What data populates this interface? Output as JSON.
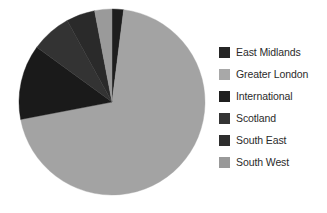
{
  "chart_data": {
    "type": "pie",
    "title": "",
    "subtitle": "",
    "xlabel": "",
    "ylabel": "",
    "grid": false,
    "legend_position": "right",
    "start_angle_deg": 0,
    "direction": "clockwise",
    "categories": [
      "East Midlands",
      "Greater London",
      "International",
      "Scotland",
      "South East",
      "South West"
    ],
    "values": [
      2,
      70,
      13,
      7,
      5,
      3
    ],
    "units": "percent",
    "slices": [
      {
        "label": "East Midlands",
        "value": 2,
        "percent": 2,
        "angle_deg": 7.2,
        "color": "#1e1e1e",
        "swatch_color": "#262626"
      },
      {
        "label": "Greater London",
        "value": 70,
        "percent": 70,
        "angle_deg": 252,
        "color": "#a3a3a3",
        "swatch_color": "#a8a8a8"
      },
      {
        "label": "International",
        "value": 13,
        "percent": 13,
        "angle_deg": 46.8,
        "color": "#1a1a1a",
        "swatch_color": "#1f1f1f"
      },
      {
        "label": "Scotland",
        "value": 7,
        "percent": 7,
        "angle_deg": 25.2,
        "color": "#333333",
        "swatch_color": "#343434"
      },
      {
        "label": "South East",
        "value": 5,
        "percent": 5,
        "angle_deg": 18,
        "color": "#2a2a2a",
        "swatch_color": "#2e2e2e"
      },
      {
        "label": "South West",
        "value": 3,
        "percent": 3,
        "angle_deg": 10.8,
        "color": "#9a9a9a",
        "swatch_color": "#999999"
      }
    ]
  },
  "legend": {
    "items": [
      {
        "label": "East Midlands"
      },
      {
        "label": "Greater London"
      },
      {
        "label": "International"
      },
      {
        "label": "Scotland"
      },
      {
        "label": "South East"
      },
      {
        "label": "South West"
      }
    ]
  },
  "colors": {
    "background": "#ffffff",
    "text": "#2b2b2b",
    "light_gray": "#a3a3a3",
    "dark_gray": "#1a1a1a"
  }
}
